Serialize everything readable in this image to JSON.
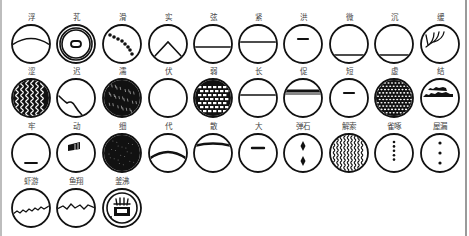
{
  "style": {
    "ink": "#111111",
    "label_color": "#444444",
    "background": "#ffffff"
  },
  "layout": {
    "col_x": [
      31,
      76,
      122,
      168,
      213,
      258,
      303,
      349,
      394,
      440
    ],
    "row_y": [
      44,
      98,
      153,
      208
    ],
    "radius": 19,
    "label_offset": -24
  },
  "symbols": [
    {
      "label": "浮",
      "icon": "arc-upper",
      "row": 0,
      "col": 0
    },
    {
      "label": "芤",
      "icon": "double-ring-hollow",
      "row": 0,
      "col": 1
    },
    {
      "label": "滑",
      "icon": "beaded-diagonal",
      "row": 0,
      "col": 2
    },
    {
      "label": "实",
      "icon": "chevron-peak",
      "row": 0,
      "col": 3
    },
    {
      "label": "弦",
      "icon": "line-middle",
      "row": 0,
      "col": 4
    },
    {
      "label": "紧",
      "icon": "line-upper-mid",
      "row": 0,
      "col": 5
    },
    {
      "label": "洪",
      "icon": "short-bar-top",
      "row": 0,
      "col": 6
    },
    {
      "label": "微",
      "icon": "line-bottom",
      "row": 0,
      "col": 7
    },
    {
      "label": "沉",
      "icon": "line-bottom",
      "row": 0,
      "col": 8
    },
    {
      "label": "缓",
      "icon": "branch-claw",
      "row": 0,
      "col": 9
    },
    {
      "label": "涩",
      "icon": "wavy-vertical-dark",
      "row": 1,
      "col": 0
    },
    {
      "label": "迟",
      "icon": "wave-corner",
      "row": 1,
      "col": 1
    },
    {
      "label": "濡",
      "icon": "filled-speckled",
      "row": 1,
      "col": 2
    },
    {
      "label": "伏",
      "icon": "empty-circle",
      "row": 1,
      "col": 3
    },
    {
      "label": "弱",
      "icon": "brick-grid-dark",
      "row": 1,
      "col": 4
    },
    {
      "label": "长",
      "icon": "line-upper-full",
      "row": 1,
      "col": 5
    },
    {
      "label": "促",
      "icon": "thick-line-top",
      "row": 1,
      "col": 6
    },
    {
      "label": "短",
      "icon": "short-bar-top",
      "row": 1,
      "col": 7
    },
    {
      "label": "虚",
      "icon": "dotted-fill",
      "row": 1,
      "col": 8
    },
    {
      "label": "结",
      "icon": "double-ragged-bars",
      "row": 1,
      "col": 9
    },
    {
      "label": "牢",
      "icon": "short-bar-bottom",
      "row": 2,
      "col": 0
    },
    {
      "label": "动",
      "icon": "small-block",
      "row": 2,
      "col": 1
    },
    {
      "label": "细",
      "icon": "filled-dark",
      "row": 2,
      "col": 2
    },
    {
      "label": "代",
      "icon": "arc-middle-rough",
      "row": 2,
      "col": 3
    },
    {
      "label": "散",
      "icon": "arc-top-rough",
      "row": 2,
      "col": 4
    },
    {
      "label": "大",
      "icon": "short-bar-upper",
      "row": 2,
      "col": 5
    },
    {
      "label": "弹石",
      "icon": "two-diamonds",
      "row": 2,
      "col": 6
    },
    {
      "label": "解索",
      "icon": "wavy-vertical-lines",
      "row": 2,
      "col": 7
    },
    {
      "label": "雀啄",
      "icon": "dotted-vertical",
      "row": 2,
      "col": 8
    },
    {
      "label": "屋漏",
      "icon": "three-dots",
      "row": 2,
      "col": 9
    },
    {
      "label": "虾游",
      "icon": "jagged-low",
      "row": 3,
      "col": 0
    },
    {
      "label": "鱼翔",
      "icon": "zigzag-middle",
      "row": 3,
      "col": 1
    },
    {
      "label": "釜沸",
      "icon": "boiling-pot",
      "row": 3,
      "col": 2
    }
  ]
}
